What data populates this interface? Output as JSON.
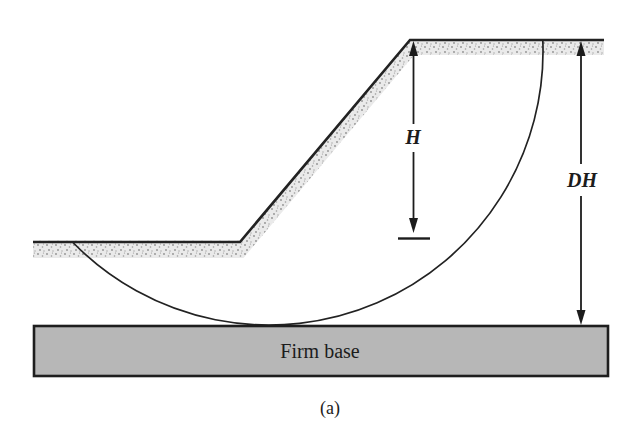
{
  "figure": {
    "caption": "(a)",
    "labels": {
      "slope_height": "H",
      "depth_to_firm_base": "DH",
      "firm_base": "Firm base"
    },
    "colors": {
      "background": "#ffffff",
      "line": "#222222",
      "firm_base_fill": "#b7b7b7",
      "ground_band_fill": "#eaeaea",
      "ground_band_speckle": "#8f8f8f"
    }
  }
}
